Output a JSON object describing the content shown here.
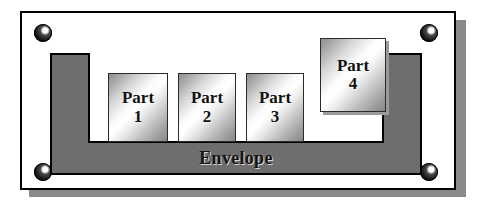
{
  "diagram": {
    "envelope": {
      "label": "Envelope",
      "fill_color": "#6e6e6e",
      "border_color": "#000000"
    },
    "plate": {
      "background_color": "#ffffff",
      "border_color": "#000000",
      "shadow_color": "#8a8a8a"
    },
    "rivets": [
      {
        "name": "rivet-top-left",
        "position": "top-left"
      },
      {
        "name": "rivet-top-right",
        "position": "top-right"
      },
      {
        "name": "rivet-bottom-left",
        "position": "bottom-left"
      },
      {
        "name": "rivet-bottom-right",
        "position": "bottom-right"
      }
    ],
    "parts": [
      {
        "word": "Part",
        "number": "1",
        "inside_envelope": true
      },
      {
        "word": "Part",
        "number": "2",
        "inside_envelope": true
      },
      {
        "word": "Part",
        "number": "3",
        "inside_envelope": true
      },
      {
        "word": "Part",
        "number": "4",
        "inside_envelope": false
      }
    ]
  }
}
